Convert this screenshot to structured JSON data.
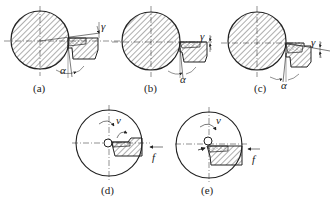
{
  "figure": {
    "panels": [
      {
        "id": "a",
        "label": "(a)",
        "symbols": {
          "rake": "γ",
          "clearance": "α"
        }
      },
      {
        "id": "b",
        "label": "(b)",
        "symbols": {
          "rake": "γ",
          "clearance": "α"
        }
      },
      {
        "id": "c",
        "label": "(c)",
        "symbols": {
          "rake": "γ",
          "clearance": "α"
        }
      },
      {
        "id": "d",
        "label": "(d)",
        "symbols": {
          "velocity": "v",
          "feed": "f"
        }
      },
      {
        "id": "e",
        "label": "(e)",
        "symbols": {
          "velocity": "v",
          "feed": "f"
        }
      }
    ]
  },
  "colors": {
    "stroke": "#222222",
    "hatch": "#333333",
    "background": "#ffffff"
  }
}
